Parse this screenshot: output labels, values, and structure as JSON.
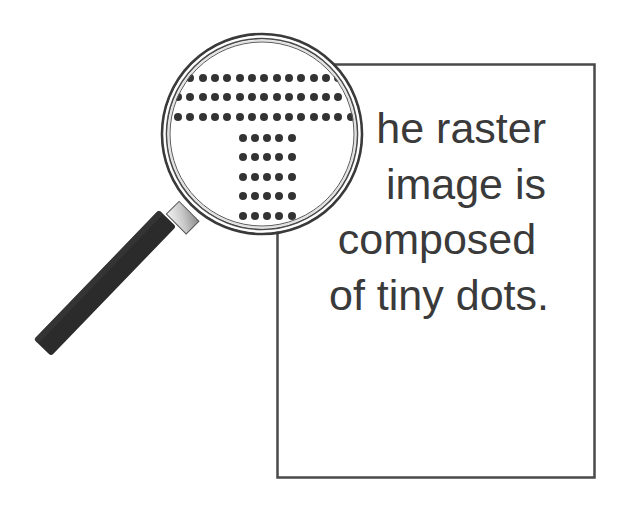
{
  "illustration": {
    "caption_lines": [
      "he raster",
      "image is",
      "composed",
      "of tiny dots."
    ],
    "magnified_letter": "T",
    "colors": {
      "ink": "#3a3a3a",
      "paper_border": "#4a4a4a",
      "handle": "#2b2b2b",
      "ferrule": "#d8d8d8",
      "background": "#ffffff"
    }
  }
}
